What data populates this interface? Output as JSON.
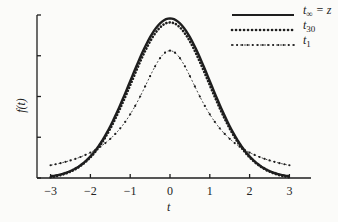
{
  "chart_data": {
    "type": "line",
    "title": "",
    "xlabel": "t",
    "ylabel": "f(t)",
    "xlim": [
      -3,
      3
    ],
    "x_ticks": [
      -3,
      -2,
      -1,
      0,
      1,
      2,
      3
    ],
    "x_tick_labels": [
      "−3",
      "−2",
      "−1",
      "0",
      "1",
      "2",
      "3"
    ],
    "y_ticks_count": 5,
    "y_tick_labels": [],
    "grid": false,
    "legend_position": "upper right",
    "series": [
      {
        "name": "t_∞ = z",
        "style": "solid",
        "x": [
          -3,
          -2.5,
          -2,
          -1.5,
          -1,
          -0.5,
          0,
          0.5,
          1,
          1.5,
          2,
          2.5,
          3
        ],
        "values": [
          0.004,
          0.018,
          0.054,
          0.13,
          0.242,
          0.352,
          0.399,
          0.352,
          0.242,
          0.13,
          0.054,
          0.018,
          0.004
        ]
      },
      {
        "name": "t_30",
        "style": "dotted",
        "x": [
          -3,
          -2.5,
          -2,
          -1.5,
          -1,
          -0.5,
          0,
          0.5,
          1,
          1.5,
          2,
          2.5,
          3
        ],
        "values": [
          0.006,
          0.02,
          0.057,
          0.131,
          0.24,
          0.348,
          0.394,
          0.348,
          0.24,
          0.131,
          0.057,
          0.02,
          0.006
        ]
      },
      {
        "name": "t_1",
        "style": "dash-dot with markers",
        "x": [
          -3,
          -2.5,
          -2,
          -1.5,
          -1,
          -0.5,
          0,
          0.5,
          1,
          1.5,
          2,
          2.5,
          3
        ],
        "values": [
          0.032,
          0.045,
          0.064,
          0.096,
          0.159,
          0.255,
          0.318,
          0.255,
          0.159,
          0.096,
          0.064,
          0.045,
          0.032
        ]
      }
    ]
  },
  "legend": {
    "item1": {
      "base": "t",
      "sub": "∞",
      "suffix": " = z"
    },
    "item2": {
      "base": "t",
      "sub": "30"
    },
    "item3": {
      "base": "t",
      "sub": "1"
    }
  },
  "axes": {
    "xlabel": "t",
    "ylabel": "f(t)",
    "x_ticks": [
      "−3",
      "−2",
      "−1",
      "0",
      "1",
      "2",
      "3"
    ]
  },
  "colors": {
    "ink": "#1e1e1e",
    "background": "#fbfbf9"
  }
}
